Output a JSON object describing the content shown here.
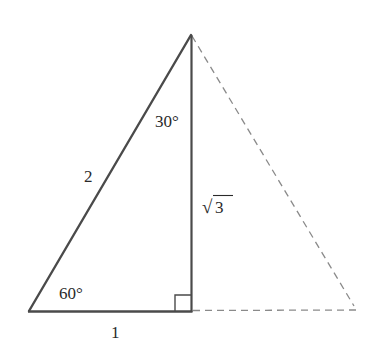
{
  "diagram": {
    "type": "geometry-triangle",
    "colors": {
      "solid_stroke": "#4a4a4a",
      "dashed_stroke": "#8a8a8a",
      "label_text": "#2a2a2a",
      "background": "#ffffff"
    },
    "vertices": {
      "apex": {
        "x": 191,
        "y": 35
      },
      "bottom_left": {
        "x": 29,
        "y": 311
      },
      "right_angle_foot": {
        "x": 192,
        "y": 311
      },
      "dashed_bottom_right": {
        "x": 355,
        "y": 308
      }
    },
    "labels": {
      "top_angle": "30°",
      "bottom_left_angle": "60°",
      "hypotenuse": "2",
      "vertical_leg": "3",
      "vertical_leg_radical": "√",
      "bottom_leg": "1"
    },
    "right_angle_marker": {
      "size": 17
    }
  }
}
